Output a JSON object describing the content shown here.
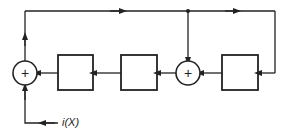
{
  "diagram": {
    "type": "block-diagram",
    "colors": {
      "stroke": "#222222",
      "background": "#ffffff"
    },
    "nodes": [
      {
        "id": "sum1",
        "kind": "summing-junction",
        "symbol": "+"
      },
      {
        "id": "block1",
        "kind": "block",
        "label": ""
      },
      {
        "id": "block2",
        "kind": "block",
        "label": ""
      },
      {
        "id": "sum2",
        "kind": "summing-junction",
        "symbol": "+"
      },
      {
        "id": "block3",
        "kind": "block",
        "label": ""
      }
    ],
    "edges": [
      {
        "from": "block3",
        "to": "sum2"
      },
      {
        "from": "sum2",
        "to": "block2"
      },
      {
        "from": "block2",
        "to": "block1"
      },
      {
        "from": "block1",
        "to": "sum1"
      },
      {
        "from": "sum1",
        "to": "feedback-top"
      },
      {
        "from": "feedback-top",
        "to": "sum2",
        "via": "junction-dot"
      },
      {
        "from": "feedback-top",
        "to": "block3",
        "via": "right-return"
      },
      {
        "from": "input",
        "to": "sum1"
      }
    ],
    "input_label": "i(X)",
    "sum_symbol": "+"
  }
}
